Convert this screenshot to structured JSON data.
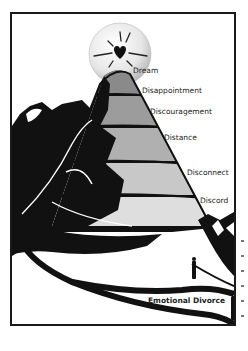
{
  "diagram": {
    "top_element": {
      "label": "Dream",
      "icon": "heart-icon"
    },
    "stages": [
      {
        "label": "Disappointment",
        "fill": "#8a8a8a"
      },
      {
        "label": "Discouragement",
        "fill": "#9c9c9c"
      },
      {
        "label": "Distance",
        "fill": "#b0b0b0"
      },
      {
        "label": "Disconnect",
        "fill": "#c8c8c8"
      },
      {
        "label": "Discord",
        "fill": "#dedede"
      }
    ],
    "bottom_label": "Emotional Divorce",
    "colors": {
      "ink": "#111111",
      "sphere_light": "#ffffff",
      "sphere_dark": "#c8c8c8",
      "frame": "#1a1a1a"
    }
  }
}
